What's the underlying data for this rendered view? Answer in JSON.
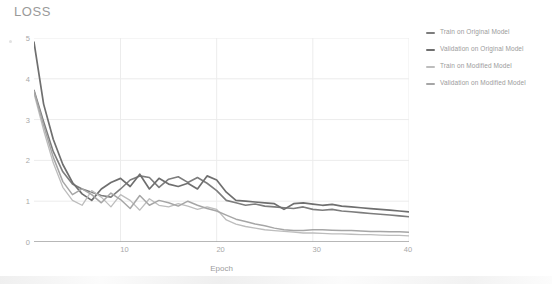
{
  "chart_data": {
    "type": "line",
    "title": "LOSS",
    "xlabel": "Epoch",
    "ylabel": "",
    "xlim": [
      1,
      40
    ],
    "ylim": [
      0,
      5
    ],
    "xticks": [
      10,
      20,
      30,
      40
    ],
    "yticks": [
      0,
      1,
      2,
      3,
      4,
      5
    ],
    "grid": true,
    "legend_position": "right",
    "x": [
      1,
      2,
      3,
      4,
      5,
      6,
      7,
      8,
      9,
      10,
      11,
      12,
      13,
      14,
      15,
      16,
      17,
      18,
      19,
      20,
      21,
      22,
      23,
      24,
      25,
      26,
      27,
      28,
      29,
      30,
      31,
      32,
      33,
      34,
      35,
      36,
      37,
      38,
      39,
      40
    ],
    "series": [
      {
        "name": "Train on Original Model",
        "color": "#7d7d7d",
        "width": 1.6,
        "values": [
          3.72,
          2.95,
          2.22,
          1.72,
          1.42,
          1.3,
          1.22,
          1.14,
          1.1,
          1.3,
          1.52,
          1.62,
          1.58,
          1.34,
          1.54,
          1.6,
          1.46,
          1.58,
          1.44,
          1.26,
          1.02,
          0.96,
          0.9,
          0.93,
          0.88,
          0.86,
          0.84,
          0.82,
          0.86,
          0.8,
          0.78,
          0.8,
          0.76,
          0.74,
          0.72,
          0.7,
          0.68,
          0.66,
          0.64,
          0.62
        ]
      },
      {
        "name": "Validation on Original Model",
        "color": "#6f6f6f",
        "width": 1.7,
        "values": [
          4.9,
          3.38,
          2.52,
          1.9,
          1.46,
          1.18,
          1.02,
          1.3,
          1.46,
          1.56,
          1.36,
          1.66,
          1.3,
          1.56,
          1.42,
          1.36,
          1.44,
          1.3,
          1.62,
          1.52,
          1.22,
          1.02,
          1.0,
          0.98,
          0.96,
          0.94,
          0.8,
          0.94,
          0.96,
          0.93,
          0.9,
          0.92,
          0.88,
          0.86,
          0.84,
          0.82,
          0.8,
          0.78,
          0.76,
          0.74
        ]
      },
      {
        "name": "Train on Modified Model",
        "color": "#bdbdbd",
        "width": 1.3,
        "values": [
          3.64,
          2.74,
          1.94,
          1.34,
          1.02,
          0.9,
          1.26,
          1.1,
          0.86,
          1.16,
          1.02,
          0.78,
          1.06,
          0.9,
          0.86,
          0.94,
          0.88,
          0.8,
          0.86,
          0.8,
          0.54,
          0.44,
          0.38,
          0.34,
          0.3,
          0.28,
          0.26,
          0.24,
          0.22,
          0.22,
          0.21,
          0.2,
          0.2,
          0.19,
          0.18,
          0.18,
          0.17,
          0.16,
          0.16,
          0.15
        ]
      },
      {
        "name": "Validation on Modified Model",
        "color": "#a6a6a6",
        "width": 1.5,
        "values": [
          3.7,
          2.86,
          2.08,
          1.48,
          1.16,
          1.3,
          1.16,
          0.96,
          1.2,
          1.04,
          0.82,
          1.14,
          0.9,
          1.02,
          0.96,
          0.88,
          1.0,
          0.9,
          0.82,
          0.76,
          0.66,
          0.56,
          0.5,
          0.44,
          0.4,
          0.34,
          0.3,
          0.28,
          0.28,
          0.3,
          0.3,
          0.29,
          0.28,
          0.28,
          0.27,
          0.26,
          0.26,
          0.25,
          0.25,
          0.24
        ]
      }
    ]
  },
  "legend": {
    "items": [
      {
        "label": "Train on Original Model"
      },
      {
        "label": "Validation on Original Model"
      },
      {
        "label": "Train on Modified Model"
      },
      {
        "label": "Validation on Modified Model"
      }
    ]
  },
  "axis": {
    "ylabels": [
      "5",
      "4",
      "3",
      "2",
      "1",
      "0"
    ],
    "xlabels": [
      "10",
      "20",
      "30",
      "40"
    ]
  }
}
